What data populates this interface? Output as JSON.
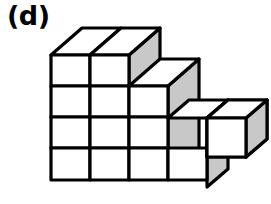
{
  "figure": {
    "label": "(d)",
    "caption_position": "top-left",
    "type": "isometric-cube-stack",
    "colors": {
      "outline": "#000000",
      "top_face": "#ffffff",
      "front_face": "#ffffff",
      "right_face": "#c8c8c8",
      "background": "#ffffff"
    },
    "geometry": {
      "cube_width": 39,
      "cube_height": 31,
      "depth_dx": 32,
      "depth_dy": -27,
      "origin_x": 51,
      "origin_y": 180,
      "stroke_width": 3.2
    },
    "structure": {
      "front_columns": 4,
      "front_rows": 4,
      "column_heights": [
        3,
        3,
        3,
        1
      ],
      "detached_cube_columns": 2,
      "notes": "Top tier is two cubes wide at left; second tier three cubes wide; a low shelf of cubes extends to the right at the bottom level"
    },
    "cube_count": {
      "visible_front_faces": 13,
      "visible_top_faces": 7,
      "visible_right_faces": 7
    }
  }
}
